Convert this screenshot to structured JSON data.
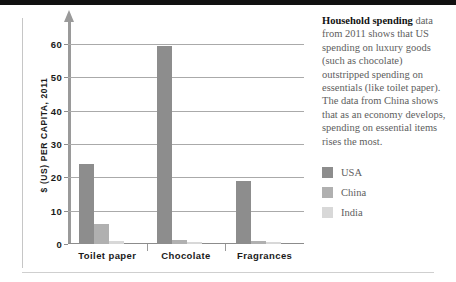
{
  "chart_data": {
    "type": "bar",
    "title": "",
    "xlabel": "",
    "ylabel": "$ (US) PER CAPITA, 2011",
    "ylim": [
      0,
      63
    ],
    "yticks": [
      0,
      10,
      20,
      30,
      40,
      50,
      60
    ],
    "ytick_labels": [
      "0",
      "10",
      "20",
      "30",
      "40",
      "50",
      "60"
    ],
    "grid": true,
    "legend_position": "right",
    "categories": [
      "Toilet paper",
      "Chocolate",
      "Fragrances"
    ],
    "series": [
      {
        "name": "USA",
        "color": "#8d8d8d",
        "values": [
          24,
          59.5,
          19
        ]
      },
      {
        "name": "China",
        "color": "#b0b0b0",
        "values": [
          6,
          1.2,
          1
        ]
      },
      {
        "name": "India",
        "color": "#d8d8d8",
        "values": [
          1,
          0.6,
          0.5
        ]
      }
    ]
  },
  "caption": {
    "lead": "Household spending",
    "body": " data from 2011 shows that US spending on luxury goods (such as chocolate) outstripped spending on essentials (like toilet paper). The data from China shows that as an economy develops, spending on essential items rises the most."
  },
  "colors": {
    "usa": "#8d8d8d",
    "china": "#b0b0b0",
    "india": "#d8d8d8",
    "axis": "#9a9a9a",
    "grid": "#aaaaaa",
    "rule": "#111111",
    "text": "#5e5e5e"
  }
}
